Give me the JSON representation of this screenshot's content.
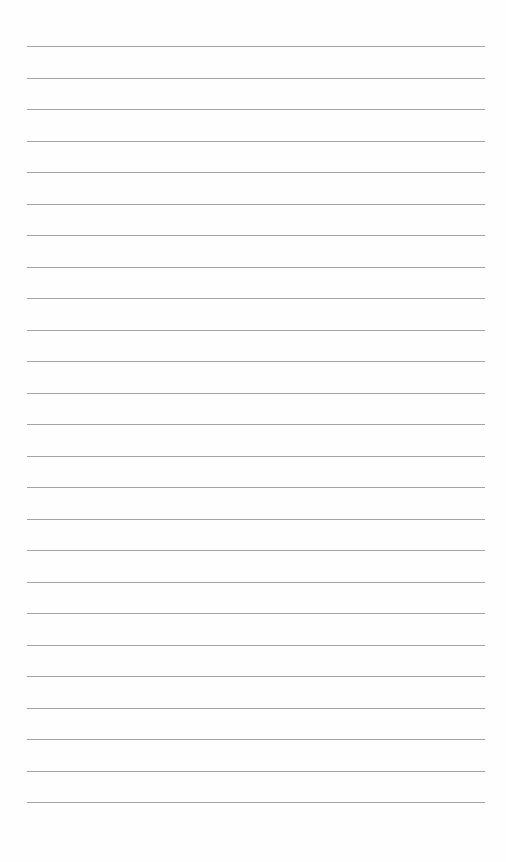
{
  "page": {
    "type": "lined-paper",
    "background_color": "#fefefe",
    "rule_color": "#a3a3a3",
    "rule_count": 25,
    "first_rule_y": 46,
    "rule_spacing": 31.5,
    "rule_left": 27,
    "rule_right": 485,
    "text_lines": []
  }
}
